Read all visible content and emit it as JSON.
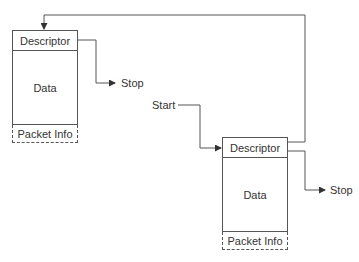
{
  "diagram": {
    "type": "linked-packet-descriptors",
    "packet1": {
      "descriptor_label": "Descriptor",
      "data_label": "Data",
      "packet_info_label": "Packet Info"
    },
    "packet2": {
      "descriptor_label": "Descriptor",
      "data_label": "Data",
      "packet_info_label": "Packet Info"
    },
    "labels": {
      "start": "Start",
      "stop1": "Stop",
      "stop2": "Stop"
    },
    "colors": {
      "line": "#555555",
      "text": "#333333"
    }
  }
}
